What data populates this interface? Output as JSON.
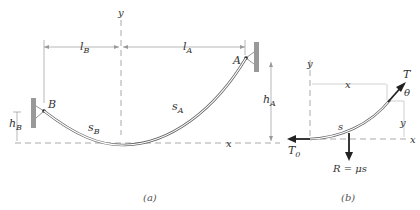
{
  "figure_a": {
    "caption": "(a)",
    "labels": {
      "y_axis": "y",
      "x_axis": "x",
      "l_B": "l",
      "l_B_sub": "B",
      "l_A": "l",
      "l_A_sub": "A",
      "point_A": "A",
      "point_B": "B",
      "h_A": "h",
      "h_A_sub": "A",
      "h_B": "h",
      "h_B_sub": "B",
      "s_A": "s",
      "s_A_sub": "A",
      "s_B": "s",
      "s_B_sub": "B"
    }
  },
  "figure_b": {
    "caption": "(b)",
    "labels": {
      "y_axis": "y",
      "x_axis": "x",
      "x_dim": "x",
      "y_dim": "y",
      "tension": "T",
      "angle": "θ",
      "arc": "s",
      "t0": "T",
      "t0_sub": "0",
      "resultant": "R = μs"
    }
  },
  "colors": {
    "line": "#555555",
    "dashed": "#999999",
    "arrow": "#222222",
    "wall": "#888888"
  }
}
